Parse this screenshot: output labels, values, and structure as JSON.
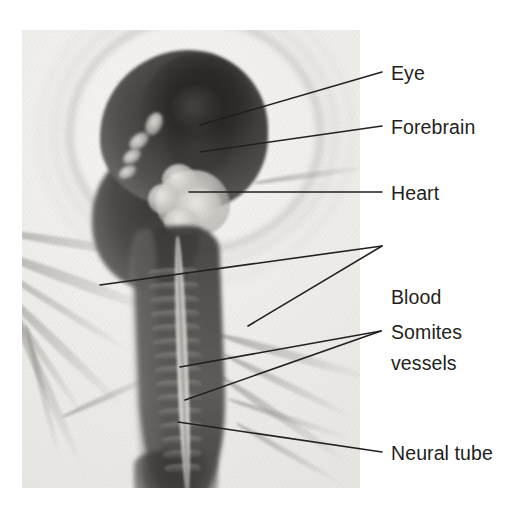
{
  "figure": {
    "kind": "labelled-micrograph",
    "photo": {
      "left": 22,
      "top": 30,
      "width": 338,
      "height": 458
    },
    "line_color": "#231f20",
    "text_color": "#231f20"
  },
  "labels": [
    {
      "id": "eye",
      "text": "Eye",
      "x": 391,
      "y": 62,
      "lines": [
        {
          "x1": 382,
          "y1": 72,
          "x2": 200,
          "y2": 125
        }
      ]
    },
    {
      "id": "forebrain",
      "text": "Forebrain",
      "x": 391,
      "y": 116,
      "lines": [
        {
          "x1": 382,
          "y1": 126,
          "x2": 200,
          "y2": 152
        }
      ]
    },
    {
      "id": "heart",
      "text": "Heart",
      "x": 391,
      "y": 182,
      "lines": [
        {
          "x1": 382,
          "y1": 192,
          "x2": 189,
          "y2": 192
        }
      ]
    },
    {
      "id": "blood-vessels",
      "text": "Blood",
      "text2": "vessels",
      "x": 391,
      "y": 242,
      "lines": [
        {
          "x1": 382,
          "y1": 246,
          "x2": 100,
          "y2": 285
        },
        {
          "x1": 382,
          "y1": 246,
          "x2": 248,
          "y2": 326
        }
      ]
    },
    {
      "id": "somites",
      "text": "Somites",
      "x": 391,
      "y": 321,
      "lines": [
        {
          "x1": 381,
          "y1": 331,
          "x2": 180,
          "y2": 367
        },
        {
          "x1": 381,
          "y1": 331,
          "x2": 185,
          "y2": 400
        }
      ]
    },
    {
      "id": "neural-tube",
      "text": "Neural tube",
      "x": 391,
      "y": 442,
      "lines": [
        {
          "x1": 382,
          "y1": 452,
          "x2": 178,
          "y2": 422
        }
      ]
    }
  ]
}
